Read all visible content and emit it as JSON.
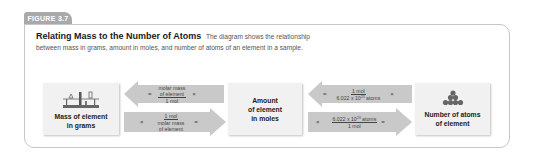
{
  "figure": {
    "label": "FIGURE 3.7",
    "title": "Relating Mass to the Number of Atoms",
    "caption_line1": "The diagram shows the relationship",
    "caption_line2": "between mass in grams, amount in moles, and number of atoms of an element in a sample."
  },
  "boxes": {
    "mass": {
      "line1": "Mass of element",
      "line2": "in grams",
      "icon": "balance-scale-icon"
    },
    "moles": {
      "line1": "Amount",
      "line2": "of element",
      "line3": "in moles"
    },
    "atoms": {
      "line1": "Number of atoms",
      "line2": "of element",
      "icon": "atom-pile-icon"
    }
  },
  "conversions": {
    "moles_to_mass": {
      "direction": "left",
      "equals": "=",
      "times": "×",
      "numerator_line1": "molar mass",
      "numerator_line2": "of element",
      "denominator": "1 mol"
    },
    "mass_to_moles": {
      "direction": "right",
      "equals": "=",
      "times": "×",
      "numerator": "1 mol",
      "denominator_line1": "molar mass",
      "denominator_line2": "of element"
    },
    "atoms_to_moles": {
      "direction": "left",
      "equals": "=",
      "times": "×",
      "numerator": "1 mol",
      "denominator_base": "6.022 x 10",
      "denominator_exp": "23",
      "denominator_unit": " atoms"
    },
    "moles_to_atoms": {
      "direction": "right",
      "equals": "=",
      "times": "×",
      "numerator_base": "6.022 x 10",
      "numerator_exp": "23",
      "numerator_unit": " atoms",
      "denominator": "1 mol"
    }
  },
  "colors": {
    "arrow_fill": "#c9c9c9",
    "box_fill": "#f1f1f1",
    "tab_fill": "#a9a9a9",
    "frame_border": "#c6c6c6"
  }
}
